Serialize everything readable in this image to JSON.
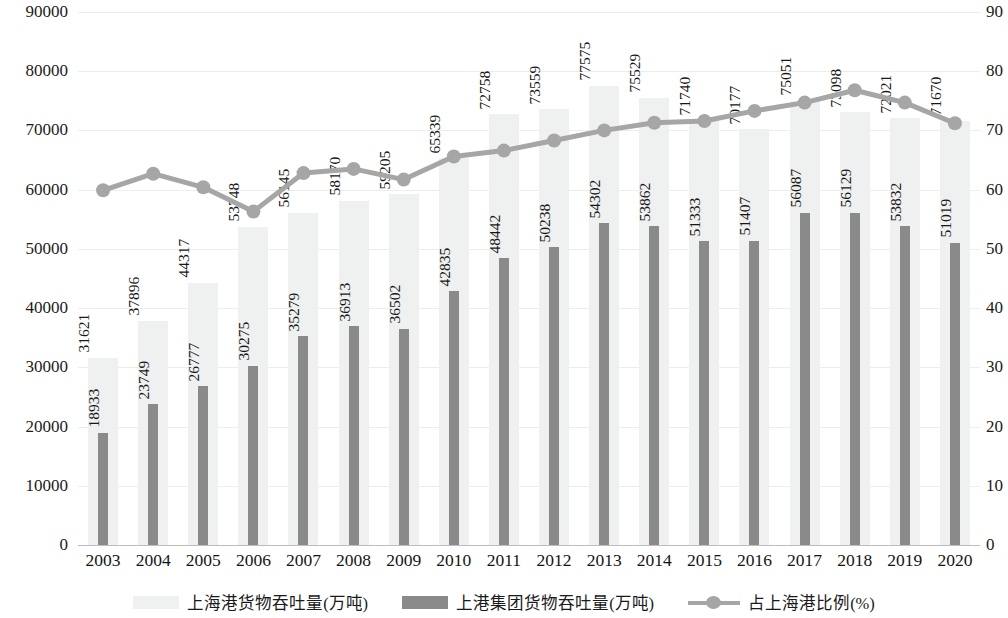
{
  "chart_data": {
    "type": "bar",
    "title": "",
    "xlabel": "",
    "ylabel": "",
    "grid": true,
    "legend_position": "bottom",
    "categories": [
      "2003",
      "2004",
      "2005",
      "2006",
      "2007",
      "2008",
      "2009",
      "2010",
      "2011",
      "2012",
      "2013",
      "2014",
      "2015",
      "2016",
      "2017",
      "2018",
      "2019",
      "2020"
    ],
    "y_left": {
      "label": "",
      "min": 0,
      "max": 90000,
      "step": 10000,
      "ticks": [
        "0",
        "10000",
        "20000",
        "30000",
        "40000",
        "50000",
        "60000",
        "70000",
        "80000",
        "90000"
      ]
    },
    "y_right": {
      "label": "",
      "min": 0,
      "max": 90,
      "step": 10,
      "ticks": [
        "0",
        "10",
        "20",
        "30",
        "40",
        "50",
        "60",
        "70",
        "80",
        "90"
      ]
    },
    "series": [
      {
        "name": "上海港货物吞吐量(万吨)",
        "type": "bar",
        "axis": "left",
        "color": "#eff0f0",
        "values": [
          31621,
          37896,
          44317,
          53748,
          56145,
          58170,
          59205,
          65339,
          72758,
          73559,
          77575,
          75529,
          71740,
          70177,
          75051,
          73098,
          72021,
          71670
        ]
      },
      {
        "name": "上港集团货物吞吐量(万吨)",
        "type": "bar",
        "axis": "left",
        "color": "#8a8a8a",
        "values": [
          18933,
          23749,
          26777,
          30275,
          35279,
          36913,
          36502,
          42835,
          48442,
          50238,
          54302,
          53862,
          51333,
          51407,
          56087,
          56129,
          53832,
          51019
        ]
      },
      {
        "name": "占上海港比例(%)",
        "type": "line",
        "axis": "right",
        "color": "#a6a6a6",
        "values": [
          59.9,
          62.7,
          60.4,
          56.3,
          62.8,
          63.5,
          61.7,
          65.6,
          66.6,
          68.3,
          70.0,
          71.3,
          71.6,
          73.3,
          74.7,
          76.8,
          74.7,
          71.2
        ]
      }
    ]
  },
  "legend": {
    "items": [
      {
        "label": "上海港货物吞吐量(万吨)",
        "swatch": "light-bar-swatch"
      },
      {
        "label": "上港集团货物吞吐量(万吨)",
        "swatch": "dark-bar-swatch"
      },
      {
        "label": "占上海港比例(%)",
        "swatch": "line-marker-swatch"
      }
    ]
  },
  "colors": {
    "bar_back": "#eff0f0",
    "bar_front": "#8a8a8a",
    "line": "#a6a6a6",
    "grid": "#ededed",
    "axis": "#bdbdbd",
    "text": "#161616"
  }
}
